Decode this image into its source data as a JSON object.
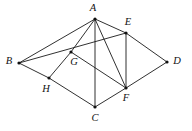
{
  "figure": {
    "type": "point-line-diagram",
    "canvas": {
      "width": 192,
      "height": 131
    },
    "style": {
      "background_color": "#ffffff",
      "line_color": "#1a1a1a",
      "vertex_color": "#111111",
      "label_color": "#111111",
      "line_width": 0.9,
      "label_font_style": "italic-serif",
      "label_font_size": 10.5
    },
    "vertices": [
      {
        "id": "A",
        "label": "A",
        "x": 95,
        "y": 19,
        "label_x": 93,
        "label_y": 9,
        "dot": true
      },
      {
        "id": "B",
        "label": "B",
        "x": 19,
        "y": 63,
        "label_x": 9,
        "label_y": 62,
        "dot": true
      },
      {
        "id": "C",
        "label": "C",
        "x": 95,
        "y": 107,
        "label_x": 95,
        "label_y": 119,
        "dot": true
      },
      {
        "id": "D",
        "label": "D",
        "x": 167,
        "y": 62,
        "label_x": 177,
        "label_y": 62,
        "dot": true
      },
      {
        "id": "E",
        "label": "E",
        "x": 126,
        "y": 33,
        "label_x": 128,
        "label_y": 23,
        "dot": true
      },
      {
        "id": "F",
        "label": "F",
        "x": 126,
        "y": 88,
        "label_x": 126,
        "label_y": 99,
        "dot": true
      },
      {
        "id": "G",
        "label": "G",
        "x": 71,
        "y": 52,
        "label_x": 74,
        "label_y": 63,
        "dot": true
      },
      {
        "id": "H",
        "label": "H",
        "x": 49,
        "y": 78,
        "label_x": 46,
        "label_y": 90,
        "dot": true
      }
    ],
    "edges": [
      {
        "id": "A-B",
        "from": "A",
        "to": "B"
      },
      {
        "id": "A-E",
        "from": "A",
        "to": "E"
      },
      {
        "id": "A-G",
        "from": "A",
        "to": "G"
      },
      {
        "id": "A-C",
        "from": "A",
        "to": "C"
      },
      {
        "id": "A-F",
        "from": "A",
        "to": "F"
      },
      {
        "id": "B-E",
        "from": "B",
        "to": "E"
      },
      {
        "id": "B-H",
        "from": "B",
        "to": "H"
      },
      {
        "id": "H-C",
        "from": "H",
        "to": "C"
      },
      {
        "id": "H-G",
        "from": "H",
        "to": "G"
      },
      {
        "id": "G-F",
        "from": "G",
        "to": "F"
      },
      {
        "id": "E-F",
        "from": "E",
        "to": "F"
      },
      {
        "id": "E-D",
        "from": "E",
        "to": "D"
      },
      {
        "id": "C-F",
        "from": "C",
        "to": "F"
      },
      {
        "id": "F-D",
        "from": "F",
        "to": "D"
      }
    ],
    "collinear_notes": [
      "B, G, E are collinear",
      "B, H, C are collinear",
      "C, F, D are collinear"
    ]
  }
}
